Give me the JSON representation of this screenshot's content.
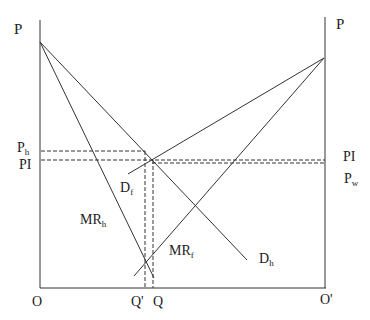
{
  "diagram": {
    "type": "two-country trade / monopoly pricing diagram",
    "left_axis_label": "P",
    "right_axis_label": "P",
    "origin_left": "O",
    "origin_right": "O'",
    "x_labels": {
      "q_prime": "Q'",
      "q": "Q"
    },
    "left_price_labels": [
      {
        "main": "P",
        "sub": "h"
      },
      {
        "main": "PI",
        "sub": ""
      }
    ],
    "right_price_labels": [
      {
        "main": "PI",
        "sub": ""
      },
      {
        "main": "P",
        "sub": "w"
      }
    ],
    "curve_labels": {
      "df": {
        "main": "D",
        "sub": "f"
      },
      "mrh": {
        "main": "MR",
        "sub": "h"
      },
      "mrf": {
        "main": "MR",
        "sub": "f"
      },
      "dh": {
        "main": "D",
        "sub": "h"
      }
    },
    "line_color": "#333333"
  }
}
